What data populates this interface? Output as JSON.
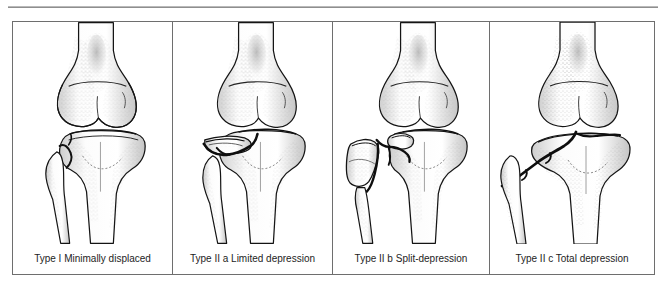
{
  "document": {
    "header_note": "",
    "figure_kind": "anatomical-illustration-table",
    "subject": "Tibial plateau fracture classification"
  },
  "figure": {
    "border_color": "#6e6e6e",
    "background_color": "#ffffff",
    "panels": [
      {
        "id": "type-1",
        "caption": "Type I Minimally displaced",
        "icon": "knee-joint-illustration",
        "fracture": "minimally-displaced-lateral-plateau"
      },
      {
        "id": "type-2a",
        "caption": "Type II a Limited depression",
        "icon": "knee-joint-illustration",
        "fracture": "limited-depression-lateral-plateau"
      },
      {
        "id": "type-2b",
        "caption": "Type II b Split-depression",
        "icon": "knee-joint-illustration",
        "fracture": "split-depression-lateral-plateau"
      },
      {
        "id": "type-2c",
        "caption": "Type II c Total depression",
        "icon": "knee-joint-illustration",
        "fracture": "total-depression-plateau"
      }
    ]
  },
  "colors": {
    "rule": "#8e8e8e",
    "outline": "#1a1a1a",
    "bone_fill": "#ffffff",
    "bone_shade": "#d9d9d9",
    "stipple": "#4a4a4a",
    "fracture_line": "#111111"
  }
}
